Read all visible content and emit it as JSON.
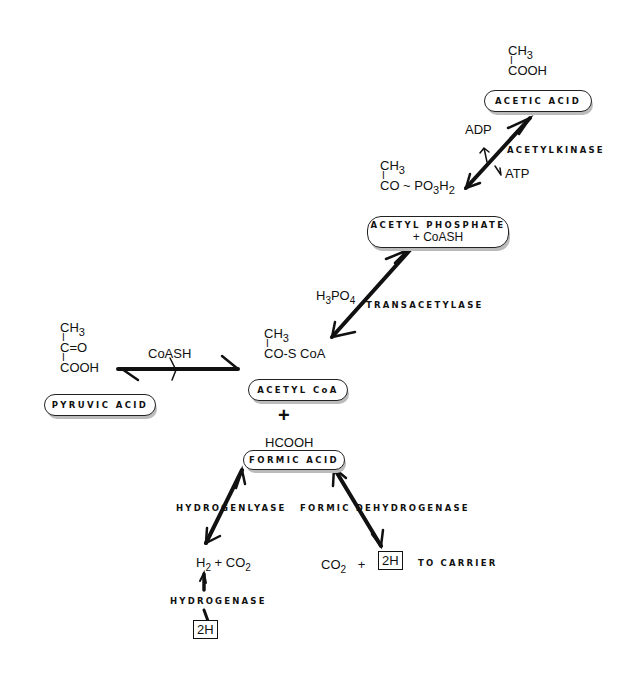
{
  "diagram": {
    "type": "metabolic-pathway",
    "compounds": {
      "acetic_acid": {
        "label": "ACETIC ACID",
        "formula_line1": "CH3",
        "bond": "I",
        "formula_line2": "COOH"
      },
      "acetyl_phosphate": {
        "label": "ACETYL PHOSPHATE",
        "label2": "+ CoASH",
        "formula_line1": "CH3",
        "bond": "I",
        "formula_line2": "CO ~ PO3H2"
      },
      "acetyl_coa": {
        "label": "ACETYL CoA",
        "formula_line1": "CH3",
        "bond": "I",
        "formula_line2": "CO-S CoA"
      },
      "pyruvic_acid": {
        "label": "PYRUVIC ACID",
        "formula_line1": "CH3",
        "bond1": "I",
        "formula_line2": "C=O",
        "bond2": "I",
        "formula_line3": "COOH"
      },
      "formic_acid": {
        "label": "FORMIC ACID",
        "formula": "HCOOH"
      }
    },
    "plus_sign": "+",
    "enzymes": {
      "acetylkinase": "ACETYLKINASE",
      "transacetylase": "TRANSACETYLASE",
      "hydrogenlyase": "HYDROGENLYASE",
      "formic_dehydrogenase": "FORMIC DEHYDROGENASE",
      "hydrogenase": "HYDROGENASE"
    },
    "cofactors": {
      "adp": "ADP",
      "atp": "ATP",
      "h3po4": "H3PO4",
      "coash": "CoASH"
    },
    "products": {
      "h2_co2": {
        "h": "H",
        "h_sub": "2",
        "plus": "+",
        "co": "CO",
        "co_sub": "2"
      },
      "co2_2h": {
        "co": "CO",
        "co_sub": "2",
        "plus": "+",
        "box": "2H",
        "suffix": "TO CARRIER"
      },
      "hydrogenase_box": "2H"
    }
  }
}
